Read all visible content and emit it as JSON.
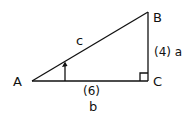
{
  "diagram": {
    "type": "right-triangle",
    "vertices": {
      "A": {
        "label": "A"
      },
      "B": {
        "label": "B"
      },
      "C": {
        "label": "C"
      }
    },
    "sides": {
      "hypotenuse": {
        "label": "c"
      },
      "vertical": {
        "label": "(4) a"
      },
      "horizontal": {
        "value_label": "(6)",
        "label": "b"
      }
    },
    "right_angle_at": "C",
    "angle_marker_at": "A",
    "colors": {
      "stroke": "#111111",
      "background": "#ffffff"
    }
  }
}
